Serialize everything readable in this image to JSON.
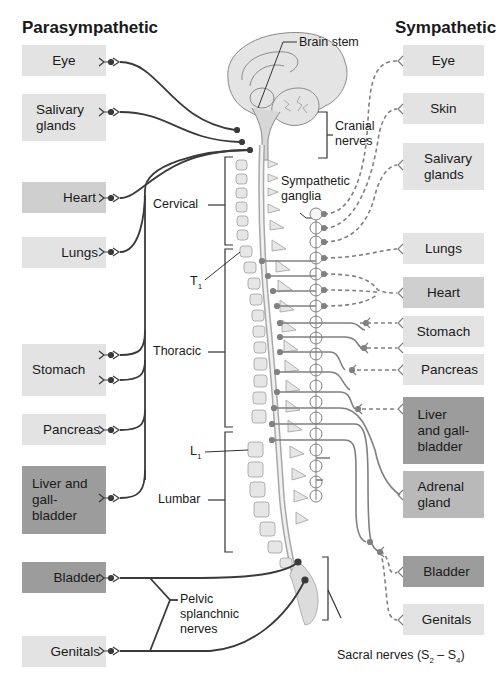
{
  "titles": {
    "left": "Parasympathetic",
    "right": "Sympathetic"
  },
  "parasympathetic": [
    {
      "label": "Eye",
      "shade": "light"
    },
    {
      "label": "Salivary glands",
      "shade": "light"
    },
    {
      "label": "Heart",
      "shade": "mid"
    },
    {
      "label": "Lungs",
      "shade": "light"
    },
    {
      "label": "Stomach",
      "shade": "light"
    },
    {
      "label": "Pancreas",
      "shade": "light"
    },
    {
      "label": "Liver and gall-bladder",
      "shade": "dark"
    },
    {
      "label": "Bladder",
      "shade": "dark"
    },
    {
      "label": "Genitals",
      "shade": "light"
    }
  ],
  "sympathetic": [
    {
      "label": "Eye",
      "shade": "light"
    },
    {
      "label": "Skin",
      "shade": "light"
    },
    {
      "label": "Salivary glands",
      "shade": "light"
    },
    {
      "label": "Lungs",
      "shade": "light"
    },
    {
      "label": "Heart",
      "shade": "mid"
    },
    {
      "label": "Stomach",
      "shade": "light"
    },
    {
      "label": "Pancreas",
      "shade": "light"
    },
    {
      "label": "Liver and gall-bladder",
      "shade": "dark"
    },
    {
      "label": "Adrenal gland",
      "shade": "mid"
    },
    {
      "label": "Bladder",
      "shade": "dark"
    },
    {
      "label": "Genitals",
      "shade": "light"
    }
  ],
  "labels": {
    "brain_stem": "Brain stem",
    "cranial_nerves": "Cranial nerves",
    "sympathetic_ganglia": "Sympathetic ganglia",
    "cervical": "Cervical",
    "t1": "T",
    "t1_sub": "1",
    "thoracic": "Thoracic",
    "l1": "L",
    "l1_sub": "1",
    "lumbar": "Lumbar",
    "pelvic_splanchnic_nerves": "Pelvic splanchnic nerves",
    "sacral_nerves": "Sacral nerves (S",
    "sacral_sub_start": "2",
    "sacral_dash": " – S",
    "sacral_sub_end": "4",
    "sacral_close": ")"
  },
  "colors": {
    "light_box": "#e3e3e3",
    "mid_box": "#cfcfcf",
    "dark_box": "#9c9c9c",
    "parasympathetic_line": "#3a3a3a",
    "sympathetic_line": "#808080"
  }
}
